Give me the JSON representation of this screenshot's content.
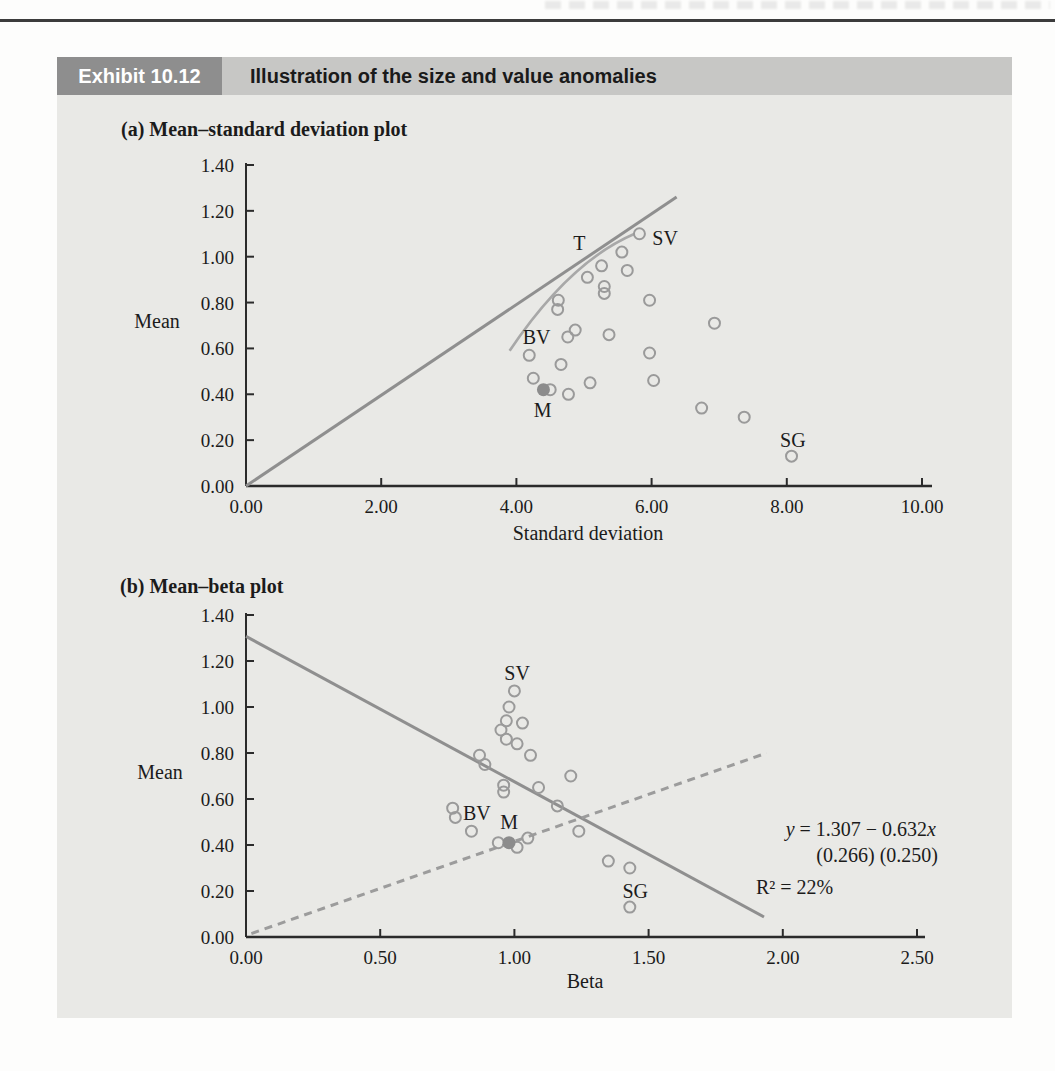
{
  "exhibit": {
    "number": "Exhibit 10.12",
    "title": "Illustration of the size and value anomalies"
  },
  "colors": {
    "panel_bg": "#e9e9e6",
    "exhibit_box_bg": "#8e8e8e",
    "exhibit_box_text": "#ffffff",
    "header_bar_bg": "#c7c7c5",
    "header_text": "#1a1a1a",
    "axis": "#2b2b2b",
    "text": "#1b1b1b",
    "marker_stroke": "#9a9a9a",
    "filled_marker": "#8c8c8c",
    "solid_line": "#8f8f8f",
    "curve": "#a8a8a8",
    "dashed_line": "#9c9c9c"
  },
  "chart_data": [
    {
      "id": "mean_sd",
      "type": "scatter",
      "title": "(a) Mean–standard deviation plot",
      "xlabel": "Standard deviation",
      "ylabel": "Mean",
      "xlim": [
        0,
        10
      ],
      "ylim": [
        0,
        1.4
      ],
      "grid": false,
      "xticks": [
        {
          "v": 0,
          "label": "0.00"
        },
        {
          "v": 2,
          "label": "2.00"
        },
        {
          "v": 4,
          "label": "4.00"
        },
        {
          "v": 6,
          "label": "6.00"
        },
        {
          "v": 8,
          "label": "8.00"
        },
        {
          "v": 10,
          "label": "10.00"
        }
      ],
      "yticks": [
        {
          "v": 0.0,
          "label": "0.00"
        },
        {
          "v": 0.2,
          "label": "0.20"
        },
        {
          "v": 0.4,
          "label": "0.40"
        },
        {
          "v": 0.6,
          "label": "0.60"
        },
        {
          "v": 0.8,
          "label": "0.80"
        },
        {
          "v": 1.0,
          "label": "1.00"
        },
        {
          "v": 1.2,
          "label": "1.20"
        },
        {
          "v": 1.4,
          "label": "1.40"
        }
      ],
      "points": [
        [
          5.82,
          1.1
        ],
        [
          5.56,
          1.02
        ],
        [
          5.26,
          0.96
        ],
        [
          5.64,
          0.94
        ],
        [
          5.05,
          0.91
        ],
        [
          5.3,
          0.87
        ],
        [
          5.3,
          0.84
        ],
        [
          4.62,
          0.81
        ],
        [
          4.61,
          0.77
        ],
        [
          5.97,
          0.81
        ],
        [
          6.93,
          0.71
        ],
        [
          4.87,
          0.68
        ],
        [
          4.76,
          0.65
        ],
        [
          5.37,
          0.66
        ],
        [
          4.19,
          0.57
        ],
        [
          5.97,
          0.58
        ],
        [
          4.66,
          0.53
        ],
        [
          4.25,
          0.47
        ],
        [
          4.5,
          0.42
        ],
        [
          4.77,
          0.4
        ],
        [
          5.09,
          0.45
        ],
        [
          6.03,
          0.46
        ],
        [
          6.74,
          0.34
        ],
        [
          7.37,
          0.3
        ],
        [
          8.07,
          0.13
        ]
      ],
      "filled_point": {
        "label": "M",
        "x": 4.4,
        "y": 0.42
      },
      "lines": [
        {
          "name": "tangency-line",
          "style": "solid",
          "from": [
            0,
            0
          ],
          "to": [
            6.37,
            1.26
          ]
        }
      ],
      "curves": [
        {
          "name": "frontier-curve",
          "start": [
            3.9,
            0.59
          ],
          "control": [
            4.79,
            0.98
          ],
          "end": [
            5.75,
            1.1
          ]
        }
      ],
      "labels": [
        {
          "text": "T",
          "x": 4.93,
          "y": 1.06
        },
        {
          "text": "SV",
          "x": 6.2,
          "y": 1.08
        },
        {
          "text": "BV",
          "x": 4.3,
          "y": 0.65
        },
        {
          "text": "M",
          "x": 4.39,
          "y": 0.33
        },
        {
          "text": "SG",
          "x": 8.09,
          "y": 0.2
        }
      ]
    },
    {
      "id": "mean_beta",
      "type": "scatter",
      "title": "(b) Mean–beta plot",
      "xlabel": "Beta",
      "ylabel": "Mean",
      "xlim": [
        0,
        2.5
      ],
      "ylim": [
        0,
        1.4
      ],
      "grid": false,
      "xticks": [
        {
          "v": 0.0,
          "label": "0.00"
        },
        {
          "v": 0.5,
          "label": "0.50"
        },
        {
          "v": 1.0,
          "label": "1.00"
        },
        {
          "v": 1.5,
          "label": "1.50"
        },
        {
          "v": 2.0,
          "label": "2.00"
        },
        {
          "v": 2.5,
          "label": "2.50"
        }
      ],
      "yticks": [
        {
          "v": 0.0,
          "label": "0.00"
        },
        {
          "v": 0.2,
          "label": "0.20"
        },
        {
          "v": 0.4,
          "label": "0.40"
        },
        {
          "v": 0.6,
          "label": "0.60"
        },
        {
          "v": 0.8,
          "label": "0.80"
        },
        {
          "v": 1.0,
          "label": "1.00"
        },
        {
          "v": 1.2,
          "label": "1.20"
        },
        {
          "v": 1.4,
          "label": "1.40"
        }
      ],
      "points": [
        [
          1.0,
          1.07
        ],
        [
          0.98,
          1.0
        ],
        [
          0.97,
          0.94
        ],
        [
          1.03,
          0.93
        ],
        [
          0.95,
          0.9
        ],
        [
          0.97,
          0.86
        ],
        [
          1.01,
          0.84
        ],
        [
          1.06,
          0.79
        ],
        [
          0.87,
          0.79
        ],
        [
          0.89,
          0.75
        ],
        [
          1.21,
          0.7
        ],
        [
          0.96,
          0.66
        ],
        [
          0.96,
          0.63
        ],
        [
          1.09,
          0.65
        ],
        [
          1.16,
          0.57
        ],
        [
          0.77,
          0.56
        ],
        [
          0.78,
          0.52
        ],
        [
          0.84,
          0.46
        ],
        [
          0.94,
          0.41
        ],
        [
          1.01,
          0.39
        ],
        [
          1.05,
          0.43
        ],
        [
          1.24,
          0.46
        ],
        [
          1.35,
          0.33
        ],
        [
          1.43,
          0.3
        ],
        [
          1.43,
          0.13
        ]
      ],
      "filled_point": {
        "label": "M",
        "x": 0.98,
        "y": 0.41
      },
      "lines": [
        {
          "name": "regression-line",
          "style": "solid",
          "from": [
            0,
            1.307
          ],
          "to": [
            1.93,
            0.087
          ]
        },
        {
          "name": "dashed-sml-line",
          "style": "dashed",
          "from": [
            0.02,
            0.015
          ],
          "to": [
            1.94,
            0.8
          ]
        }
      ],
      "labels": [
        {
          "text": "SV",
          "x": 1.01,
          "y": 1.15
        },
        {
          "text": "BV",
          "x": 0.86,
          "y": 0.54
        },
        {
          "text": "M",
          "x": 0.98,
          "y": 0.5
        },
        {
          "text": "SG",
          "x": 1.45,
          "y": 0.2
        }
      ],
      "annotations": [
        {
          "text": "y = 1.307 − 0.632x"
        },
        {
          "text": "(0.266) (0.250)"
        },
        {
          "text": "R² = 22%"
        }
      ],
      "regression": {
        "intercept": 1.307,
        "slope": -0.632,
        "se_intercept": 0.266,
        "se_slope": 0.25,
        "r_squared": "22%"
      }
    }
  ]
}
